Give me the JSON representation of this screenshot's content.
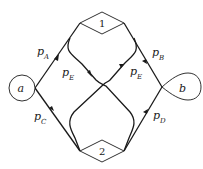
{
  "diagram": {
    "type": "network reliability / flow graph",
    "nodes": [
      {
        "id": "a",
        "label": "a",
        "shape": "circle",
        "role": "source"
      },
      {
        "id": "1",
        "label": "1",
        "shape": "diamond"
      },
      {
        "id": "2",
        "label": "2",
        "shape": "diamond"
      },
      {
        "id": "b",
        "label": "b",
        "shape": "loop",
        "role": "sink"
      }
    ],
    "edges": [
      {
        "from": "a",
        "to": "1",
        "label": "p",
        "subscript": "A"
      },
      {
        "from": "a",
        "to": "2",
        "label": "p",
        "subscript": "C"
      },
      {
        "from": "1",
        "to": "b",
        "label": "p",
        "subscript": "B"
      },
      {
        "from": "2",
        "to": "b",
        "label": "p",
        "subscript": "D"
      },
      {
        "from": "1",
        "to": "2",
        "label": "p",
        "subscript": "E",
        "note": "crossing link, left side of 1 to right side of 2"
      },
      {
        "from": "2",
        "to": "1",
        "label": "p",
        "subscript": "E",
        "note": "crossing link, left side of 2 to right side of 1"
      }
    ]
  },
  "labels": {
    "a": "a",
    "b": "b",
    "n1": "1",
    "n2": "2",
    "pA": {
      "p": "p",
      "sub": "A"
    },
    "pB": {
      "p": "p",
      "sub": "B"
    },
    "pC": {
      "p": "p",
      "sub": "C"
    },
    "pD": {
      "p": "p",
      "sub": "D"
    },
    "pE_left": {
      "p": "p",
      "sub": "E"
    },
    "pE_right": {
      "p": "p",
      "sub": "E"
    }
  }
}
